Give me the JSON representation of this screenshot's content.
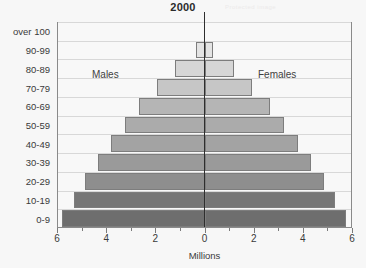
{
  "chart": {
    "title": "2000",
    "watermark": "Protected image",
    "axis_title": "Millions",
    "males_label": "Males",
    "females_label": "Females"
  },
  "chart_data": {
    "type": "bar",
    "subtype": "population-pyramid",
    "title": "2000",
    "xlabel": "Millions",
    "ylabel": "",
    "xlim": [
      -6,
      6
    ],
    "xticks": [
      6,
      4,
      2,
      0,
      2,
      4,
      6
    ],
    "xtick_labels": [
      "6",
      "4",
      "2",
      "0",
      "2",
      "4",
      "6"
    ],
    "minor_tick_step": 1,
    "grid": true,
    "legend": "none",
    "categories": [
      "0-9",
      "10-19",
      "20-29",
      "30-39",
      "40-49",
      "50-59",
      "60-69",
      "70-79",
      "80-89",
      "90-99",
      "over 100"
    ],
    "series": [
      {
        "name": "Males",
        "side": "left",
        "values": [
          5.8,
          5.3,
          4.85,
          4.35,
          3.8,
          3.25,
          2.65,
          1.95,
          1.2,
          0.35,
          0.0
        ]
      },
      {
        "name": "Females",
        "side": "right",
        "values": [
          5.75,
          5.3,
          4.85,
          4.35,
          3.8,
          3.25,
          2.65,
          1.95,
          1.2,
          0.35,
          0.0
        ]
      }
    ],
    "bar_colors": [
      "#6e6e6e",
      "#767676",
      "#8e8e8e",
      "#9a9a9a",
      "#a3a3a3",
      "#ababab",
      "#b5b5b5",
      "#c6c6c6",
      "#d6d6d6",
      "#e4e4e4",
      "#f2f2f2"
    ],
    "bar_border_color": "#7d7d7d",
    "axis_color": "#2e2e2e",
    "grid_color": "#d8d8d8",
    "background": "#f7f7f7"
  }
}
